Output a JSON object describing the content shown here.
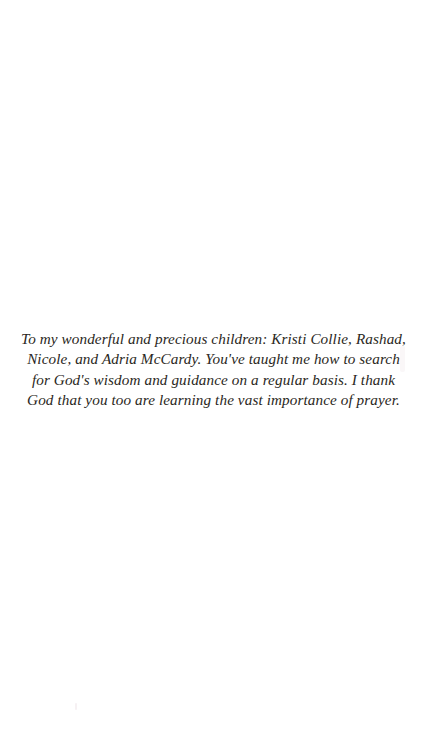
{
  "page": {
    "type": "book-dedication-page",
    "background_color": "#ffffff",
    "text_color": "#2a2722"
  },
  "dedication": {
    "full_text": "To my wonderful and precious children: Kristi Collie, Rashad, Nicole, and Adria McCardy. You've taught me how to search for God's wisdom and guidance on a regular basis. I thank God that you too are learning the vast importance of prayer.",
    "lines": [
      "To my wonderful and precious children: Kristi Collie, Rashad,",
      "Nicole, and Adria McCardy. You've taught me how to search",
      "for God's wisdom and guidance on a regular basis. I thank",
      "God that you too are learning the vast importance of prayer."
    ]
  }
}
